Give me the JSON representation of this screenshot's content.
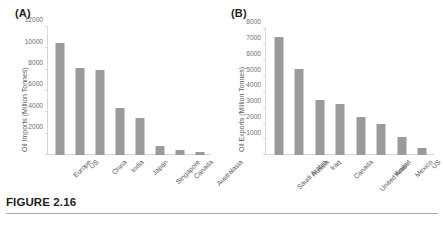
{
  "figure": {
    "caption": "FIGURE 2.16",
    "panel_a_label": "(A)",
    "panel_b_label": "(B)"
  },
  "style": {
    "bar_color": "#9b9b9b",
    "axis_color": "#d7d7d7",
    "tick_label_color": "#6d6e71",
    "text_color": "#231f20"
  },
  "chart_data": [
    {
      "type": "bar",
      "panel": "(A)",
      "title": "",
      "xlabel": "",
      "ylabel": "Oil Imports (Million Tonnes)",
      "ylim": [
        0,
        12000
      ],
      "yticks": [
        0,
        2000,
        4000,
        6000,
        8000,
        10000,
        12000
      ],
      "ytick_labels": [
        "",
        "2000",
        "4000",
        "6000",
        "8000",
        "10000",
        "12000"
      ],
      "grid": false,
      "legend": "none",
      "categories": [
        "Europe",
        "US",
        "China",
        "India",
        "Japan",
        "Singapore",
        "Canada",
        "Australasia"
      ],
      "values": [
        10500,
        8200,
        8000,
        4400,
        3500,
        800,
        450,
        300
      ]
    },
    {
      "type": "bar",
      "panel": "(B)",
      "title": "",
      "xlabel": "",
      "ylabel": "Oil Exports (Million Tonnes)",
      "ylim": [
        0,
        8000
      ],
      "yticks": [
        0,
        1000,
        2000,
        3000,
        4000,
        5000,
        6000,
        7000,
        8000
      ],
      "ytick_labels": [
        "",
        "1000",
        "2000",
        "3000",
        "4000",
        "5000",
        "6000",
        "7000",
        "8000"
      ],
      "grid": false,
      "legend": "none",
      "categories": [
        "Saudi Arabia",
        "Russia",
        "Iraq",
        "Canada",
        "United Arab...",
        "Kuwait",
        "Mexico",
        "US"
      ],
      "values": [
        7500,
        5450,
        3500,
        3250,
        2400,
        2000,
        1150,
        450
      ]
    }
  ]
}
